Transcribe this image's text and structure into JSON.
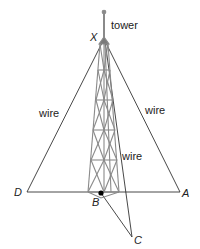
{
  "diagram": {
    "labels": {
      "tower": "tower",
      "wire_left": "wire",
      "wire_right": "wire",
      "wire_middle": "wire"
    },
    "points": {
      "X": "X",
      "D": "D",
      "A": "A",
      "B": "B",
      "C": "C"
    },
    "segments": [
      "XD",
      "XA",
      "XC",
      "DA",
      "BC",
      "XB"
    ],
    "colors": {
      "line": "#333333",
      "tower": "#8a8a8a",
      "point": "#000000"
    }
  }
}
